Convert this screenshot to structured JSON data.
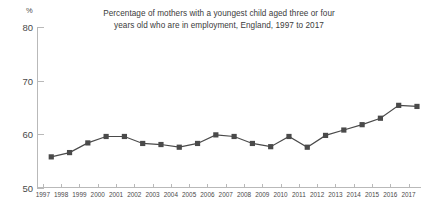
{
  "chart_data": {
    "type": "line",
    "title": "Percentage of mothers with a youngest child aged three or four years old who are in employment, England, 1997 to 2017",
    "title_lines": [
      "Percentage of mothers with a youngest child aged three or four",
      "years old who are in employment, England, 1997 to 2017"
    ],
    "xlabel": "",
    "ylabel": "%",
    "unit_label": "%",
    "ylim": [
      50,
      80
    ],
    "yticks": [
      50,
      60,
      70,
      80
    ],
    "ytick_labels": [
      "50",
      "60",
      "70",
      "80"
    ],
    "grid": false,
    "legend": false,
    "marker": "square",
    "series_color": "#4a4a4a",
    "axis_color": "#b9b9b9",
    "text_color": "#4a4a4a",
    "categories": [
      "1997",
      "1998",
      "1999",
      "2000",
      "2001",
      "2002",
      "2003",
      "2004",
      "2005",
      "2006",
      "2007",
      "2008",
      "2009",
      "2010",
      "2011",
      "2012",
      "2013",
      "2014",
      "2015",
      "2016",
      "2017"
    ],
    "values": [
      55.8,
      56.6,
      58.4,
      59.6,
      59.6,
      58.3,
      58.1,
      57.6,
      58.3,
      59.9,
      59.6,
      58.3,
      57.7,
      59.6,
      57.6,
      59.8,
      60.8,
      61.8,
      63.0,
      65.4,
      65.2
    ]
  }
}
